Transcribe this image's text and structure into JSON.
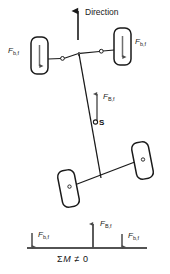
{
  "figure": {
    "type": "engineering-diagram",
    "background_color": "#ffffff",
    "line_color": "#1a1a1a",
    "arrow_color": "#555555"
  },
  "direction": {
    "label": "Direction",
    "arrow_icon": "up-arrow-icon"
  },
  "labels": {
    "brake_force_wheel": "F",
    "brake_force_wheel_sub": "b,f",
    "brake_force_body": "F",
    "brake_force_body_sub": "B,f",
    "center_point": "S"
  },
  "front_axle": {
    "left_wheel": {
      "name": "left-front-wheel",
      "force_label": "F",
      "force_sub": "b,f",
      "arrow": "down-arrow-icon"
    },
    "right_wheel": {
      "name": "right-front-wheel",
      "force_label": "F",
      "force_sub": "b,f",
      "arrow": "down-arrow-icon"
    },
    "center_force": {
      "name": "axle-center-force",
      "label": "F",
      "sub": "B,f",
      "arrow": "up-arrow-icon"
    }
  },
  "rear_axle": {
    "left_wheel": {
      "name": "left-rear-wheel"
    },
    "right_wheel": {
      "name": "right-rear-wheel"
    }
  },
  "moment_diagram": {
    "left_force": {
      "label": "F",
      "sub": "b,f",
      "arrow": "down-arrow-icon"
    },
    "center_force": {
      "label": "F",
      "sub": "B,f",
      "arrow": "up-arrow-icon"
    },
    "right_force": {
      "label": "F",
      "sub": "b,f",
      "arrow": "down-arrow-icon"
    },
    "equation_sigma": "Σ",
    "equation_m": "M",
    "equation_rel": "≠",
    "equation_value": "0"
  }
}
